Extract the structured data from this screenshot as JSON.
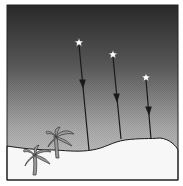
{
  "diagram": {
    "colors": {
      "sky_top": "#2e2e2e",
      "sky_bottom": "#c8c8c8",
      "ground": "#f7f7f7",
      "line": "#1a1a1a",
      "star": "#ffffff",
      "palm": "#9a9a9a",
      "frame": "#222222"
    },
    "stars": [
      {
        "id": "star-1",
        "x": 79,
        "y": 42,
        "ground_x": 89,
        "ground_y": 150,
        "arrow_y": 84
      },
      {
        "id": "star-2",
        "x": 113,
        "y": 54,
        "ground_x": 121,
        "ground_y": 139,
        "arrow_y": 98
      },
      {
        "id": "star-3",
        "x": 146,
        "y": 77,
        "ground_x": 151,
        "ground_y": 139,
        "arrow_y": 111
      }
    ],
    "palm_trees": [
      {
        "id": "palm-back",
        "x": 57,
        "y": 140
      },
      {
        "id": "palm-front",
        "x": 35,
        "y": 158
      }
    ]
  }
}
